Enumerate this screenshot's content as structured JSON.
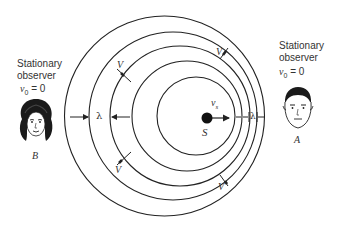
{
  "diagram": {
    "observer_left": {
      "line1": "Stationary",
      "line2": "observer",
      "velocity_symbol": "v",
      "velocity_sub": "0",
      "velocity_value": "= 0",
      "name": "B"
    },
    "observer_right": {
      "line1": "Stationary",
      "line2": "observer",
      "velocity_symbol": "v",
      "velocity_sub": "0",
      "velocity_value": "= 0",
      "name": "A"
    },
    "source": {
      "label": "S",
      "velocity_symbol": "v",
      "velocity_sub": "s"
    },
    "wavelength_left": "λ",
    "wavelength_right": "λ",
    "wave_speed_labels": [
      "V",
      "V",
      "V",
      "V"
    ],
    "wavefronts": [
      {
        "cx": 164.5,
        "cy": 116,
        "r": 100
      },
      {
        "cx": 173,
        "cy": 116,
        "r": 84
      },
      {
        "cx": 180,
        "cy": 116,
        "r": 70
      },
      {
        "cx": 187,
        "cy": 116,
        "r": 55
      },
      {
        "cx": 196,
        "cy": 116,
        "r": 39
      }
    ],
    "stroke_color": "#222222"
  }
}
